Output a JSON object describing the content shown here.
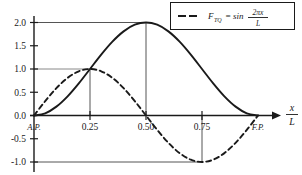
{
  "chart_data": {
    "type": "line",
    "title": "",
    "xlabel": "x/L",
    "ylabel": "",
    "xlim": [
      0,
      1.12
    ],
    "ylim": [
      -1.0,
      2.0
    ],
    "grid": true,
    "legend_position": "top-right",
    "x_ticks": [
      {
        "value": 0.0,
        "label": "A.P.",
        "style": "endpoint"
      },
      {
        "value": 0.25,
        "label": "0.25",
        "style": "numeric"
      },
      {
        "value": 0.5,
        "label": "0.50",
        "style": "numeric"
      },
      {
        "value": 0.75,
        "label": "0.75",
        "style": "numeric"
      },
      {
        "value": 1.0,
        "label": "F.P.",
        "style": "endpoint"
      }
    ],
    "y_ticks": [
      {
        "value": 2.0,
        "label": "2.0"
      },
      {
        "value": 1.5,
        "label": "1.5"
      },
      {
        "value": 1.0,
        "label": "1.0"
      },
      {
        "value": 0.5,
        "label": "0.5"
      },
      {
        "value": 0.0,
        "label": "0.0"
      },
      {
        "value": -0.5,
        "label": "-0.5"
      },
      {
        "value": -1.0,
        "label": "-1.0"
      }
    ],
    "series": [
      {
        "name": "solid-curve",
        "style": "solid",
        "color": "#1a1a1a",
        "description": "1 - cos(2 pi x / L)",
        "x": [
          0.0,
          0.05,
          0.1,
          0.15,
          0.2,
          0.25,
          0.3,
          0.35,
          0.4,
          0.45,
          0.5,
          0.55,
          0.6,
          0.65,
          0.7,
          0.75,
          0.8,
          0.85,
          0.9,
          0.95,
          1.0
        ],
        "y": [
          0.0,
          0.048,
          0.191,
          0.412,
          0.691,
          1.0,
          1.309,
          1.588,
          1.809,
          1.952,
          2.0,
          1.952,
          1.809,
          1.588,
          1.309,
          1.0,
          0.691,
          0.412,
          0.191,
          0.048,
          0.0
        ]
      },
      {
        "name": "dashed-curve",
        "style": "dashed",
        "color": "#1a1a1a",
        "description": "sin(2 pi x / L)",
        "x": [
          0.0,
          0.05,
          0.1,
          0.15,
          0.2,
          0.25,
          0.3,
          0.35,
          0.4,
          0.45,
          0.5,
          0.55,
          0.6,
          0.65,
          0.7,
          0.75,
          0.8,
          0.85,
          0.9,
          0.95,
          1.0
        ],
        "y": [
          0.0,
          0.309,
          0.588,
          0.809,
          0.951,
          1.0,
          0.951,
          0.809,
          0.588,
          0.309,
          0.0,
          -0.309,
          -0.588,
          -0.809,
          -0.951,
          -1.0,
          -0.951,
          -0.809,
          -0.588,
          -0.309,
          0.0
        ]
      }
    ],
    "gridlines": [
      {
        "axis": "y",
        "value": 2.0,
        "from_x": 0.0,
        "to_x": 0.5,
        "color": "#555555"
      },
      {
        "axis": "y",
        "value": 1.0,
        "from_x": 0.0,
        "to_x": 0.25,
        "color": "#888888"
      },
      {
        "axis": "y",
        "value": -1.0,
        "from_x": 0.0,
        "to_x": 0.75,
        "color": "#555555"
      },
      {
        "axis": "x",
        "value": 0.25,
        "from_y": 0.0,
        "to_y": 1.0,
        "color": "#555555"
      },
      {
        "axis": "x",
        "value": 0.5,
        "from_y": 0.0,
        "to_y": 2.0,
        "color": "#555555"
      },
      {
        "axis": "x",
        "value": 0.75,
        "from_y": 0.0,
        "to_y": -1.0,
        "color": "#555555"
      }
    ],
    "legend": {
      "entries": [
        {
          "style": "dashed",
          "symbol": "F",
          "subscript": "TQ",
          "equals": "=",
          "function": "sin",
          "numerator": "2πx",
          "denominator": "L"
        }
      ]
    },
    "annotations": []
  },
  "axis_label": {
    "numerator": "x",
    "denominator": "L"
  }
}
